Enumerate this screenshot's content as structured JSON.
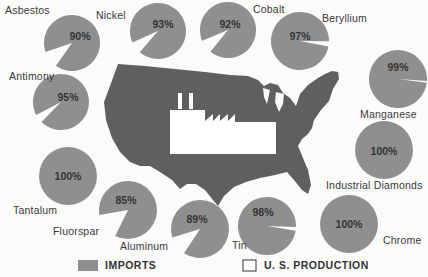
{
  "chart_data": {
    "type": "pie",
    "title": "",
    "legend": [
      {
        "label": "IMPORTS",
        "color": "#8f8f8f"
      },
      {
        "label": "U. S. PRODUCTION",
        "color": "#ffffff"
      }
    ],
    "categories": [
      "Asbestos",
      "Nickel",
      "Cobalt",
      "Beryllium",
      "Antimony",
      "Manganese",
      "Tantalum",
      "Industrial Diamonds",
      "Fluorspar",
      "Aluminum",
      "Tin",
      "Chrome"
    ],
    "series": [
      {
        "name": "Imports",
        "values": [
          90,
          93,
          92,
          97,
          95,
          99,
          100,
          100,
          85,
          89,
          98,
          100
        ]
      },
      {
        "name": "U. S. Production",
        "values": [
          10,
          7,
          8,
          3,
          5,
          1,
          0,
          0,
          15,
          11,
          2,
          0
        ]
      }
    ]
  },
  "pies": [
    {
      "name": "Asbestos",
      "pct": 90,
      "label": "90%",
      "cx": 72,
      "cy": 43,
      "r": 28,
      "lx": 5,
      "ly": 4,
      "px": 80,
      "py": 30
    },
    {
      "name": "Nickel",
      "pct": 93,
      "label": "93%",
      "cx": 158,
      "cy": 31,
      "r": 28,
      "lx": 96,
      "ly": 9,
      "px": 163,
      "py": 18
    },
    {
      "name": "Cobalt",
      "pct": 92,
      "label": "92%",
      "cx": 228,
      "cy": 30,
      "r": 28,
      "lx": 253,
      "ly": 3,
      "px": 230,
      "py": 18
    },
    {
      "name": "Beryllium",
      "pct": 97,
      "label": "97%",
      "cx": 300,
      "cy": 41,
      "r": 29,
      "lx": 322,
      "ly": 12,
      "px": 300,
      "py": 30
    },
    {
      "name": "Antimony",
      "pct": 95,
      "label": "95%",
      "cx": 61,
      "cy": 102,
      "r": 28,
      "lx": 9,
      "ly": 70,
      "px": 68,
      "py": 91
    },
    {
      "name": "Manganese",
      "pct": 99,
      "label": "99%",
      "cx": 398,
      "cy": 79,
      "r": 29,
      "lx": 360,
      "ly": 108,
      "px": 398,
      "py": 61
    },
    {
      "name": "Tantalum",
      "pct": 100,
      "label": "100%",
      "cx": 68,
      "cy": 176,
      "r": 29,
      "lx": 13,
      "ly": 204,
      "px": 68,
      "py": 170
    },
    {
      "name": "Industrial Diamonds",
      "pct": 100,
      "label": "100%",
      "cx": 384,
      "cy": 150,
      "r": 29,
      "lx": 326,
      "ly": 179,
      "px": 384,
      "py": 145
    },
    {
      "name": "Fluorspar",
      "pct": 85,
      "label": "85%",
      "cx": 128,
      "cy": 210,
      "r": 29,
      "lx": 53,
      "ly": 225,
      "px": 126,
      "py": 194
    },
    {
      "name": "Aluminum",
      "pct": 89,
      "label": "89%",
      "cx": 200,
      "cy": 229,
      "r": 29,
      "lx": 120,
      "ly": 240,
      "px": 197,
      "py": 213
    },
    {
      "name": "Tin",
      "pct": 98,
      "label": "98%",
      "cx": 267,
      "cy": 226,
      "r": 29,
      "lx": 232,
      "ly": 239,
      "px": 263,
      "py": 206
    },
    {
      "name": "Chrome",
      "pct": 100,
      "label": "100%",
      "cx": 349,
      "cy": 224,
      "r": 29,
      "lx": 383,
      "ly": 234,
      "px": 349,
      "py": 218
    }
  ],
  "legend": {
    "imports_label": "IMPORTS",
    "production_label": "U. S. PRODUCTION"
  },
  "colors": {
    "pie": "#8f8f8f",
    "map": "#5f5f5f",
    "background": "#fbfbfa",
    "factory": "#ffffff"
  }
}
